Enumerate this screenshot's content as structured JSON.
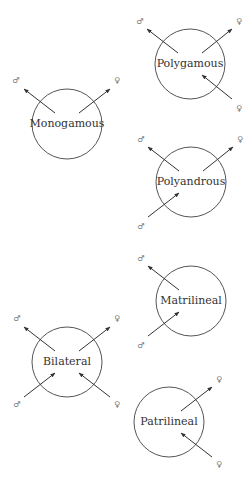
{
  "diagram": {
    "title": "",
    "symbols": {
      "male": "♂",
      "female": "♀"
    },
    "colors": {
      "stroke": "#555555",
      "text": "#333333",
      "symbol": "#777777"
    },
    "nodes": [
      {
        "id": "monogamous",
        "label": "Monogamous",
        "cx": 67,
        "cy": 124,
        "r": 35,
        "arrows": [
          {
            "dir": "out",
            "x1": 55,
            "y1": 113,
            "x2": 24,
            "y2": 89,
            "symbol": "♂",
            "sx": 16,
            "sy": 80
          },
          {
            "dir": "out",
            "x1": 79,
            "y1": 113,
            "x2": 110,
            "y2": 89,
            "symbol": "♀",
            "sx": 117,
            "sy": 80
          }
        ]
      },
      {
        "id": "polygamous",
        "label": "Polygamous",
        "cx": 190,
        "cy": 64,
        "r": 35,
        "arrows": [
          {
            "dir": "out",
            "x1": 178,
            "y1": 53,
            "x2": 147,
            "y2": 29,
            "symbol": "♂",
            "sx": 140,
            "sy": 21
          },
          {
            "dir": "out",
            "x1": 202,
            "y1": 53,
            "x2": 232,
            "y2": 29,
            "symbol": "♀",
            "sx": 239,
            "sy": 21
          },
          {
            "dir": "in",
            "x1": 232,
            "y1": 99,
            "x2": 202,
            "y2": 75,
            "symbol": "♀",
            "sx": 239,
            "sy": 108
          }
        ]
      },
      {
        "id": "polyandrous",
        "label": "Polyandrous",
        "cx": 191,
        "cy": 182,
        "r": 35,
        "arrows": [
          {
            "dir": "out",
            "x1": 179,
            "y1": 171,
            "x2": 148,
            "y2": 147,
            "symbol": "♂",
            "sx": 141,
            "sy": 139
          },
          {
            "dir": "out",
            "x1": 203,
            "y1": 171,
            "x2": 233,
            "y2": 147,
            "symbol": "♀",
            "sx": 240,
            "sy": 139
          },
          {
            "dir": "in",
            "x1": 148,
            "y1": 217,
            "x2": 179,
            "y2": 193,
            "symbol": "♂",
            "sx": 141,
            "sy": 226
          }
        ]
      },
      {
        "id": "matrilineal",
        "label": "Matrilineal",
        "cx": 191,
        "cy": 301,
        "r": 35,
        "arrows": [
          {
            "dir": "out",
            "x1": 179,
            "y1": 290,
            "x2": 148,
            "y2": 266,
            "symbol": "♂",
            "sx": 141,
            "sy": 258
          },
          {
            "dir": "in",
            "x1": 148,
            "y1": 336,
            "x2": 179,
            "y2": 312,
            "symbol": "♂",
            "sx": 141,
            "sy": 345
          }
        ]
      },
      {
        "id": "bilateral",
        "label": "Bilateral",
        "cx": 67,
        "cy": 362,
        "r": 35,
        "arrows": [
          {
            "dir": "out",
            "x1": 55,
            "y1": 351,
            "x2": 24,
            "y2": 327,
            "symbol": "♂",
            "sx": 17,
            "sy": 318
          },
          {
            "dir": "out",
            "x1": 79,
            "y1": 351,
            "x2": 110,
            "y2": 327,
            "symbol": "♀",
            "sx": 117,
            "sy": 318
          },
          {
            "dir": "in",
            "x1": 24,
            "y1": 397,
            "x2": 55,
            "y2": 373,
            "symbol": "♂",
            "sx": 17,
            "sy": 404
          },
          {
            "dir": "in",
            "x1": 110,
            "y1": 397,
            "x2": 79,
            "y2": 373,
            "symbol": "♀",
            "sx": 117,
            "sy": 404
          }
        ]
      },
      {
        "id": "patrilineal",
        "label": "Patrilineal",
        "cx": 169,
        "cy": 422,
        "r": 35,
        "arrows": [
          {
            "dir": "out",
            "x1": 181,
            "y1": 411,
            "x2": 212,
            "y2": 387,
            "symbol": "♀",
            "sx": 219,
            "sy": 379
          },
          {
            "dir": "in",
            "x1": 212,
            "y1": 457,
            "x2": 181,
            "y2": 433,
            "symbol": "♀",
            "sx": 219,
            "sy": 464
          }
        ]
      }
    ]
  }
}
